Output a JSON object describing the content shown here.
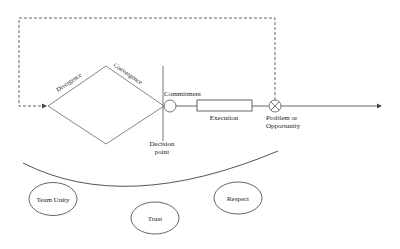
{
  "diagram": {
    "labels": {
      "divergence": "Divergence",
      "convergence": "Convergence",
      "commitment": "Commitment",
      "execution": "Execution",
      "problem_line1": "Problem or",
      "problem_line2": "Opportunity",
      "decision_line1": "Decision",
      "decision_line2": "point"
    },
    "foundation": {
      "values": [
        {
          "label": "Team Unity"
        },
        {
          "label": "Trust"
        },
        {
          "label": "Respect"
        }
      ]
    },
    "colors": {
      "stroke": "#555555",
      "text": "#222222",
      "background": "#ffffff"
    }
  }
}
